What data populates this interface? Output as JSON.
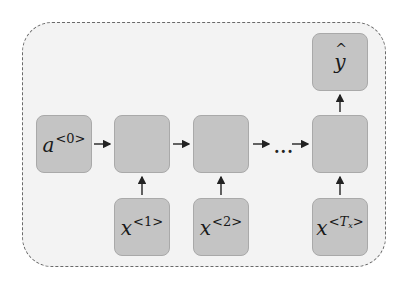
{
  "diagram": {
    "container": {
      "style": "dashed",
      "fill": "#f3f3f3",
      "border": "#6a6a6a"
    },
    "colors": {
      "box_fill": "#c4c4c4",
      "box_border": "#a9a9a9",
      "arrow": "#222222"
    },
    "initial_state": {
      "base": "a",
      "superscript": "<0>"
    },
    "cells": [
      {
        "id": "cell-1",
        "label": ""
      },
      {
        "id": "cell-2",
        "label": ""
      },
      {
        "id": "cell-T",
        "label": ""
      }
    ],
    "ellipsis": "...",
    "inputs": [
      {
        "base": "x",
        "superscript": "<1>"
      },
      {
        "base": "x",
        "superscript": "<2>"
      },
      {
        "base": "x",
        "sup_open": "<",
        "sup_var": "T",
        "sup_sub": "x",
        "sup_close": ">"
      }
    ],
    "output": {
      "base": "y",
      "hat": "^"
    }
  }
}
